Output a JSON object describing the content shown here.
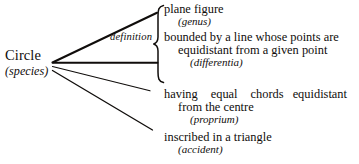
{
  "diagram": {
    "ink_color": "#100d0b",
    "background": "#ffffff",
    "root": {
      "name": "Circle",
      "tag": "(species)"
    },
    "group_label": {
      "definition": "definition"
    },
    "branches": [
      {
        "id": "genus",
        "line1": "plane figure",
        "line2": "(genus)",
        "predicable": "genus"
      },
      {
        "id": "differentia",
        "line1": "bounded by a line whose points are",
        "line2": "equidistant from a given point",
        "line3": "(differentia)",
        "predicable": "differentia"
      },
      {
        "id": "proprium",
        "line1a": "having",
        "line1b": "equal",
        "line1c": "chords",
        "line1d": "equidistant",
        "line2": "from the centre",
        "line3": "(proprium)",
        "predicable": "proprium"
      },
      {
        "id": "accident",
        "line1": "inscribed in a triangle",
        "line2": "(accident)",
        "predicable": "accident"
      }
    ],
    "connectors": [
      {
        "name": "connector-to-genus",
        "from": [
          52,
          62
        ],
        "to": [
          157,
          13
        ]
      },
      {
        "name": "connector-to-differentia",
        "from": [
          52,
          62
        ],
        "to": [
          157,
          62
        ]
      },
      {
        "name": "connector-to-proprium",
        "from": [
          52,
          66
        ],
        "to": [
          150,
          91
        ]
      },
      {
        "name": "connector-to-accident",
        "from": [
          52,
          70
        ],
        "to": [
          152,
          130
        ]
      }
    ]
  }
}
